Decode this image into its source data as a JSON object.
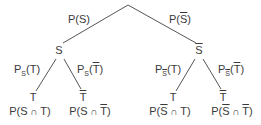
{
  "diagram": {
    "type": "probability-tree",
    "colors": {
      "line": "#555555",
      "text": "#3a3a3a",
      "background": "#ffffff"
    },
    "level1": {
      "left_edge": {
        "prefix": "P(",
        "event": "S",
        "event_bar": false,
        "suffix": ")"
      },
      "right_edge": {
        "prefix": "P(",
        "event": "S",
        "event_bar": true,
        "suffix": ")"
      },
      "left_node": {
        "label": "S",
        "bar": false
      },
      "right_node": {
        "label": "S",
        "bar": true
      }
    },
    "level2": {
      "left": {
        "edge_t": {
          "p": "P",
          "cond": "S",
          "cond_bar": false,
          "open": "(",
          "event": "T",
          "event_bar": false,
          "close": ")"
        },
        "edge_tbar": {
          "p": "P",
          "cond": "S",
          "cond_bar": false,
          "open": "(",
          "event": "T",
          "event_bar": true,
          "close": ")"
        },
        "node_t": {
          "label": "T",
          "bar": false
        },
        "node_tbar": {
          "label": "T",
          "bar": true
        },
        "leaf_t": {
          "open": "P(",
          "a": "S",
          "a_bar": false,
          "cap": " ∩ ",
          "b": "T",
          "b_bar": false,
          "close": ")"
        },
        "leaf_tbar": {
          "open": "P(",
          "a": "S",
          "a_bar": false,
          "cap": " ∩ ",
          "b": "T",
          "b_bar": true,
          "close": ")"
        }
      },
      "right": {
        "edge_t": {
          "p": "P",
          "cond": "S",
          "cond_bar": true,
          "open": "(",
          "event": "T",
          "event_bar": false,
          "close": ")"
        },
        "edge_tbar": {
          "p": "P",
          "cond": "S",
          "cond_bar": true,
          "open": "(",
          "event": "T",
          "event_bar": true,
          "close": ")"
        },
        "node_t": {
          "label": "T",
          "bar": false
        },
        "node_tbar": {
          "label": "T",
          "bar": true
        },
        "leaf_t": {
          "open": "P(",
          "a": "S",
          "a_bar": true,
          "cap": " ∩ ",
          "b": "T",
          "b_bar": false,
          "close": ")"
        },
        "leaf_tbar": {
          "open": "P(",
          "a": "S",
          "a_bar": true,
          "cap": " ∩ ",
          "b": "T",
          "b_bar": true,
          "close": ")"
        }
      }
    }
  }
}
